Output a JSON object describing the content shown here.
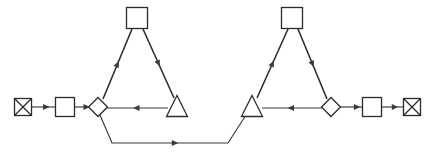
{
  "canvas": {
    "width": 435,
    "height": 160,
    "background": "#ffffff",
    "stroke_color": "#2b2b2b",
    "edge_color": "#3a3a3a",
    "fill_color": "#ffffff",
    "title": "Process Flow Diagram"
  },
  "legend": {
    "shape_names": {
      "crossed_square": "crossed-square",
      "square": "square",
      "diamond": "diamond",
      "triangle": "triangle"
    }
  },
  "nodes": [
    {
      "id": "source-terminal",
      "shape": "crossed_square",
      "label": "",
      "x": 23,
      "y": 107,
      "size": 17
    },
    {
      "id": "input-square",
      "shape": "square",
      "label": "",
      "x": 65,
      "y": 107,
      "size": 19
    },
    {
      "id": "left-diamond",
      "shape": "diamond",
      "label": "",
      "x": 98,
      "y": 107,
      "size": 19
    },
    {
      "id": "left-apex-square",
      "shape": "square",
      "label": "",
      "x": 137,
      "y": 18,
      "size": 21
    },
    {
      "id": "left-triangle",
      "shape": "triangle",
      "label": "",
      "x": 177,
      "y": 107,
      "size": 21
    },
    {
      "id": "right-triangle",
      "shape": "triangle",
      "label": "",
      "x": 252,
      "y": 107,
      "size": 21
    },
    {
      "id": "right-apex-square",
      "shape": "square",
      "label": "",
      "x": 292,
      "y": 18,
      "size": 21
    },
    {
      "id": "right-diamond",
      "shape": "diamond",
      "label": "",
      "x": 331,
      "y": 107,
      "size": 19
    },
    {
      "id": "output-square",
      "shape": "square",
      "label": "",
      "x": 372,
      "y": 107,
      "size": 19
    },
    {
      "id": "sink-terminal",
      "shape": "crossed_square",
      "label": "",
      "x": 412,
      "y": 107,
      "size": 17
    }
  ],
  "edges": [
    {
      "id": "edge-source-to-input",
      "from": "source-terminal",
      "to": "input-square",
      "label": "",
      "points": "32,107 55,107",
      "arrow_at": 0.62,
      "thick": false
    },
    {
      "id": "edge-input-to-left-diamond",
      "from": "input-square",
      "to": "left-diamond",
      "label": "",
      "points": "75,107 88,107",
      "arrow_at": 0.9,
      "thick": false
    },
    {
      "id": "edge-left-diamond-to-apex",
      "from": "left-diamond",
      "to": "left-apex-square",
      "label": "",
      "points": "103,99 132,29",
      "arrow_at": 0.5,
      "thick": true
    },
    {
      "id": "edge-left-apex-to-triangle",
      "from": "left-apex-square",
      "to": "left-triangle",
      "label": "",
      "points": "143,29 174,98",
      "arrow_at": 0.5,
      "thick": true
    },
    {
      "id": "edge-left-triangle-to-diamond",
      "from": "left-triangle",
      "to": "left-diamond",
      "label": "",
      "points": "168,108 107,108",
      "arrow_at": 0.52,
      "thick": false
    },
    {
      "id": "edge-left-diamond-to-right-triangle",
      "from": "left-diamond",
      "to": "right-triangle",
      "label": "",
      "points": "100,115 112,143 228,143 246,115",
      "arrow_at": 0.52,
      "thick": false
    },
    {
      "id": "edge-right-triangle-to-apex",
      "from": "right-triangle",
      "to": "right-apex-square",
      "label": "",
      "points": "257,98 288,29",
      "arrow_at": 0.5,
      "thick": true
    },
    {
      "id": "edge-right-apex-to-diamond",
      "from": "right-apex-square",
      "to": "right-diamond",
      "label": "",
      "points": "298,29 327,99",
      "arrow_at": 0.5,
      "thick": true
    },
    {
      "id": "edge-right-diamond-to-triangle",
      "from": "right-diamond",
      "to": "right-triangle",
      "label": "",
      "points": "322,108 262,108",
      "arrow_at": 0.52,
      "thick": false
    },
    {
      "id": "edge-right-diamond-to-output",
      "from": "right-diamond",
      "to": "output-square",
      "label": "",
      "points": "340,107 362,107",
      "arrow_at": 0.78,
      "thick": false
    },
    {
      "id": "edge-output-to-sink",
      "from": "output-square",
      "to": "sink-terminal",
      "label": "",
      "points": "382,107 403,107",
      "arrow_at": 0.62,
      "thick": false
    }
  ]
}
